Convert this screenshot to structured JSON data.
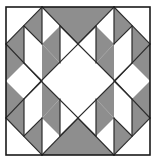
{
  "figure": {
    "title": "Quilt Block Diagram",
    "description": "Four-by-four patchwork quilt block with a white on-point square in the center, gray and white half-square triangles forming a diagonal band, and quarter-square triangle units at the edge midpoints.",
    "kind": "quilt-block"
  },
  "canvas": {
    "width": 156,
    "height": 162,
    "background": "#ffffff"
  },
  "block": {
    "x": 6,
    "y": 7,
    "width": 144,
    "height": 148,
    "rows": 4,
    "cols": 4,
    "border_color": "#1a1a1a",
    "border_width": 1.6
  },
  "palette": {
    "fabric_light": "#ffffff",
    "fabric_dark": "#8e8e8e",
    "seam_line": "#2b2b2b",
    "outline": "#1a1a1a"
  },
  "style": {
    "seam_width": 1.2
  },
  "cells": [
    {
      "row": 0,
      "col": 0,
      "name": "top-left-corner",
      "unit": "half-square-triangle",
      "split": "anti-diagonal",
      "fill_a": "#ffffff",
      "fill_b": "#ffffff",
      "seams": []
    },
    {
      "row": 0,
      "col": 1,
      "name": "top-row-inner-left",
      "unit": "half-square-triangle",
      "split": "main-diagonal",
      "fill_a": "#8e8e8e",
      "fill_b": "#ffffff",
      "seams": [
        "main-diagonal"
      ]
    },
    {
      "row": 0,
      "col": 2,
      "name": "top-row-inner-right",
      "unit": "half-square-triangle",
      "split": "anti-diagonal",
      "fill_a": "#8e8e8e",
      "fill_b": "#ffffff",
      "seams": [
        "anti-diagonal"
      ]
    },
    {
      "row": 0,
      "col": 3,
      "name": "top-right-corner",
      "unit": "half-square-triangle",
      "split": "main-diagonal",
      "fill_a": "#ffffff",
      "fill_b": "#ffffff",
      "seams": []
    },
    {
      "row": 1,
      "col": 0,
      "name": "left-edge-upper",
      "unit": "half-square-triangle",
      "split": "main-diagonal",
      "fill_a": "#ffffff",
      "fill_b": "#8e8e8e",
      "seams": [
        "main-diagonal"
      ]
    },
    {
      "row": 1,
      "col": 1,
      "name": "inner-upper-left",
      "unit": "half-square-triangle",
      "split": "anti-diagonal",
      "fill_a": "#ffffff",
      "fill_b": "#8e8e8e",
      "seams": [
        "anti-diagonal"
      ]
    },
    {
      "row": 1,
      "col": 2,
      "name": "inner-upper-right",
      "unit": "half-square-triangle",
      "split": "main-diagonal",
      "fill_a": "#8e8e8e",
      "fill_b": "#ffffff",
      "seams": [
        "main-diagonal"
      ]
    },
    {
      "row": 1,
      "col": 3,
      "name": "right-edge-upper",
      "unit": "half-square-triangle",
      "split": "anti-diagonal",
      "fill_a": "#8e8e8e",
      "fill_b": "#ffffff",
      "seams": [
        "anti-diagonal"
      ]
    },
    {
      "row": 2,
      "col": 0,
      "name": "left-edge-lower",
      "unit": "half-square-triangle",
      "split": "anti-diagonal",
      "fill_a": "#8e8e8e",
      "fill_b": "#ffffff",
      "seams": [
        "anti-diagonal"
      ]
    },
    {
      "row": 2,
      "col": 1,
      "name": "inner-lower-left",
      "unit": "half-square-triangle",
      "split": "main-diagonal",
      "fill_a": "#8e8e8e",
      "fill_b": "#ffffff",
      "seams": [
        "main-diagonal"
      ]
    },
    {
      "row": 2,
      "col": 2,
      "name": "inner-lower-right",
      "unit": "half-square-triangle",
      "split": "anti-diagonal",
      "fill_a": "#ffffff",
      "fill_b": "#8e8e8e",
      "seams": [
        "anti-diagonal"
      ]
    },
    {
      "row": 2,
      "col": 3,
      "name": "right-edge-lower",
      "unit": "half-square-triangle",
      "split": "main-diagonal",
      "fill_a": "#ffffff",
      "fill_b": "#8e8e8e",
      "seams": [
        "main-diagonal"
      ]
    },
    {
      "row": 3,
      "col": 0,
      "name": "bottom-left-corner",
      "unit": "half-square-triangle",
      "split": "main-diagonal",
      "fill_a": "#ffffff",
      "fill_b": "#ffffff",
      "seams": []
    },
    {
      "row": 3,
      "col": 1,
      "name": "bottom-row-inner-left",
      "unit": "half-square-triangle",
      "split": "anti-diagonal",
      "fill_a": "#ffffff",
      "fill_b": "#8e8e8e",
      "seams": [
        "anti-diagonal"
      ]
    },
    {
      "row": 3,
      "col": 2,
      "name": "bottom-row-inner-right",
      "unit": "half-square-triangle",
      "split": "main-diagonal",
      "fill_a": "#ffffff",
      "fill_b": "#8e8e8e",
      "seams": [
        "main-diagonal"
      ]
    },
    {
      "row": 3,
      "col": 3,
      "name": "bottom-right-corner",
      "unit": "half-square-triangle",
      "split": "anti-diagonal",
      "fill_a": "#ffffff",
      "fill_b": "#ffffff",
      "seams": []
    }
  ],
  "edge_units": [
    {
      "name": "top-center-quarter-square",
      "position": "top",
      "cx": 78,
      "outer_triangle_fill": "#8e8e8e",
      "inner_triangle_fill": "#ffffff"
    },
    {
      "name": "bottom-center-quarter-square",
      "position": "bottom",
      "cx": 78,
      "outer_triangle_fill": "#8e8e8e",
      "inner_triangle_fill": "#ffffff"
    },
    {
      "name": "left-center-quarter-square",
      "position": "left",
      "cy": 81,
      "outer_triangle_fill": "#8e8e8e",
      "inner_triangle_fill": "#ffffff"
    },
    {
      "name": "right-center-quarter-square",
      "position": "right",
      "cy": 81,
      "outer_triangle_fill": "#8e8e8e",
      "inner_triangle_fill": "#ffffff"
    }
  ],
  "center": {
    "name": "center-on-point-square",
    "shape": "diamond",
    "fill": "#ffffff",
    "points": "78,44 115,81 78,118 41,81"
  }
}
